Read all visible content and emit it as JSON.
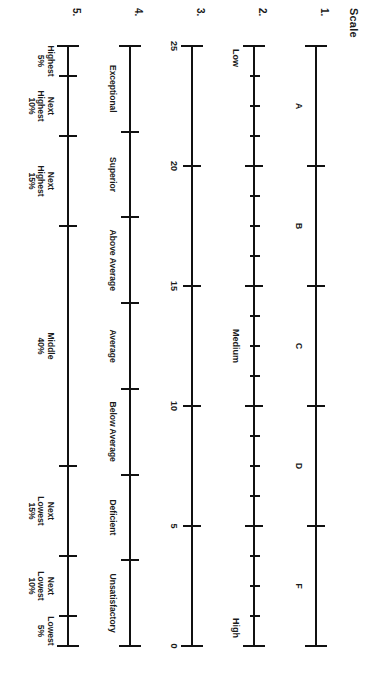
{
  "figure": {
    "title": "Scale",
    "orientation_deg": 90,
    "ink_color": "#111111",
    "background": "#ffffff"
  },
  "scales": [
    {
      "number": "1.",
      "kind": "letter-grade",
      "ticks": [
        0,
        20,
        40,
        60,
        80,
        100
      ],
      "end_ticks": [
        0,
        100
      ],
      "segments": [
        {
          "label": "A",
          "center": 10
        },
        {
          "label": "B",
          "center": 30
        },
        {
          "label": "C",
          "center": 50
        },
        {
          "label": "D",
          "center": 70
        },
        {
          "label": "F",
          "center": 90
        }
      ]
    },
    {
      "number": "2.",
      "kind": "graduated-ruler",
      "major_ticks": [
        0,
        20,
        40,
        60,
        80,
        100
      ],
      "minor_ticks": [
        5,
        10,
        15,
        25,
        30,
        35,
        45,
        50,
        55,
        65,
        70,
        75,
        85,
        90,
        95
      ],
      "edge_labels": [
        {
          "label": "Low",
          "position": 0
        },
        {
          "label": "Medium",
          "position": 50
        },
        {
          "label": "High",
          "position": 100
        }
      ]
    },
    {
      "number": "3.",
      "kind": "numeric",
      "ticks": [
        0,
        20,
        40,
        60,
        80,
        100
      ],
      "end_ticks": [
        0,
        100
      ],
      "tick_labels": [
        {
          "label": "25",
          "position": 0
        },
        {
          "label": "20",
          "position": 20
        },
        {
          "label": "15",
          "position": 40
        },
        {
          "label": "10",
          "position": 60
        },
        {
          "label": "5",
          "position": 80
        },
        {
          "label": "0",
          "position": 100
        }
      ]
    },
    {
      "number": "4.",
      "kind": "descriptive",
      "ticks": [
        0,
        14.28,
        28.57,
        42.85,
        57.14,
        71.42,
        85.71,
        100
      ],
      "end_ticks": [
        0,
        100
      ],
      "segments": [
        {
          "label": "Exceptional",
          "center": 7.14
        },
        {
          "label": "Superior",
          "center": 21.42
        },
        {
          "label": "Above Average",
          "center": 35.71
        },
        {
          "label": "Average",
          "center": 50
        },
        {
          "label": "Below Average",
          "center": 64.28
        },
        {
          "label": "Deficient",
          "center": 78.57
        },
        {
          "label": "Unsatisfactory",
          "center": 92.85
        }
      ]
    },
    {
      "number": "5.",
      "kind": "percentile-band",
      "ticks": [
        0,
        5,
        15,
        30,
        70,
        85,
        95,
        100
      ],
      "end_ticks": [
        0,
        100
      ],
      "segments": [
        {
          "label": "Highest\n5%",
          "center": 2.5
        },
        {
          "label": "Next\nHighest\n10%",
          "center": 10
        },
        {
          "label": "Next\nHighest\n15%",
          "center": 22.5
        },
        {
          "label": "Middle\n40%",
          "center": 50
        },
        {
          "label": "Next\nLowest\n15%",
          "center": 77.5
        },
        {
          "label": "Next\nLowest\n10%",
          "center": 90
        },
        {
          "label": "Lowest\n5%",
          "center": 97.5
        }
      ]
    }
  ]
}
